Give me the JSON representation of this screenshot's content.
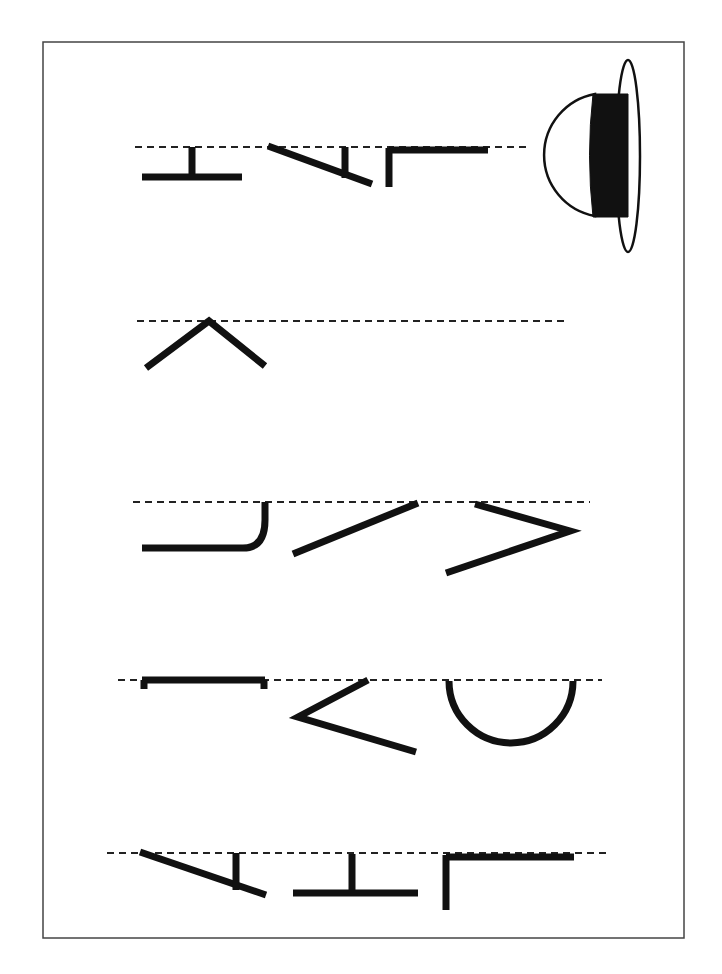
{
  "worksheet": {
    "title": "Letter tracing worksheet (rotated)",
    "colors": {
      "ink": "#111111",
      "frame": "#444444",
      "paper": "#ffffff"
    },
    "frame": {
      "x": 43,
      "y": 42,
      "w": 641,
      "h": 896
    },
    "rows": [
      {
        "id": "row-1",
        "guide": {
          "x1": 135,
          "x2": 530,
          "y": 147
        },
        "strokes": [
          {
            "name": "letter-h-stem",
            "d": "M 192 147 L 192 177"
          },
          {
            "name": "letter-h-bar",
            "d": "M 142 177 L 242 177"
          },
          {
            "name": "letter-a-diagonal",
            "d": "M 268 146 L 372 184"
          },
          {
            "name": "letter-a-crossbar",
            "d": "M 345 147 L 345 178"
          },
          {
            "name": "letter-t-stem",
            "d": "M 389 148 L 389 187"
          },
          {
            "name": "letter-t-bar",
            "d": "M 389 150 L 488 150"
          }
        ]
      },
      {
        "id": "row-2",
        "guide": {
          "x1": 137,
          "x2": 568,
          "y": 321
        },
        "strokes": [
          {
            "name": "chevron-stroke",
            "d": "M 146 368 L 209 321 L 265 366"
          }
        ]
      },
      {
        "id": "row-3",
        "guide": {
          "x1": 133,
          "x2": 590,
          "y": 502
        },
        "strokes": [
          {
            "name": "hook-stroke",
            "d": "M 142 548 L 243 548 Q 265 548 265 520 L 265 502"
          },
          {
            "name": "diagonal-stroke",
            "d": "M 293 554 L 418 503"
          },
          {
            "name": "angle-stroke",
            "d": "M 475 504 L 570 531 L 446 573"
          }
        ]
      },
      {
        "id": "row-4",
        "guide": {
          "x1": 118,
          "x2": 602,
          "y": 680
        },
        "strokes": [
          {
            "name": "bracket-bar",
            "d": "M 142 680 L 265 680"
          },
          {
            "name": "bracket-left-tick",
            "d": "M 144 680 L 144 689"
          },
          {
            "name": "bracket-right-tick",
            "d": "M 264 680 L 264 689"
          },
          {
            "name": "less-than-stroke",
            "d": "M 368 680 L 298 717 L 416 752"
          },
          {
            "name": "semicircle-stroke",
            "d": "M 449 681 A 62 62 0 0 0 573 681"
          }
        ]
      },
      {
        "id": "row-5",
        "guide": {
          "x1": 107,
          "x2": 611,
          "y": 853
        },
        "strokes": [
          {
            "name": "letter-a-diagonal",
            "d": "M 140 852 L 266 895"
          },
          {
            "name": "letter-a-crossbar",
            "d": "M 236 853 L 236 890"
          },
          {
            "name": "letter-h-stem",
            "d": "M 352 854 L 352 893"
          },
          {
            "name": "letter-h-bar",
            "d": "M 293 893 L 418 893"
          },
          {
            "name": "letter-t-stem",
            "d": "M 446 855 L 446 910"
          },
          {
            "name": "letter-t-bar",
            "d": "M 446 857 L 574 857"
          }
        ]
      }
    ],
    "hat": {
      "dome": "M 595 94 A 62 62 0 0 0 595 216 Z",
      "band": "M 593 94 L 628 94 L 628 217 L 593 217 Q 586 155 593 94 Z",
      "brim": {
        "cx": 628,
        "cy": 156,
        "rx": 12,
        "ry": 96
      }
    }
  }
}
